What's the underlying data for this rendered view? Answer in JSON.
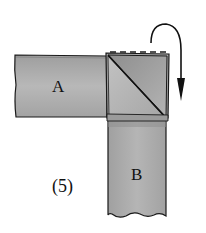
{
  "figure": {
    "step_label": "(5)",
    "strip_a_label": "A",
    "strip_b_label": "B",
    "fold_arrow": "fold-over-clockwise-arrow",
    "colors": {
      "strip_fill": "#a9a9a9",
      "strip_fill_light": "#bdbdbd",
      "fold_dark": "#9a9a9a",
      "outline": "#1a1a1a",
      "background": "#ffffff"
    }
  }
}
